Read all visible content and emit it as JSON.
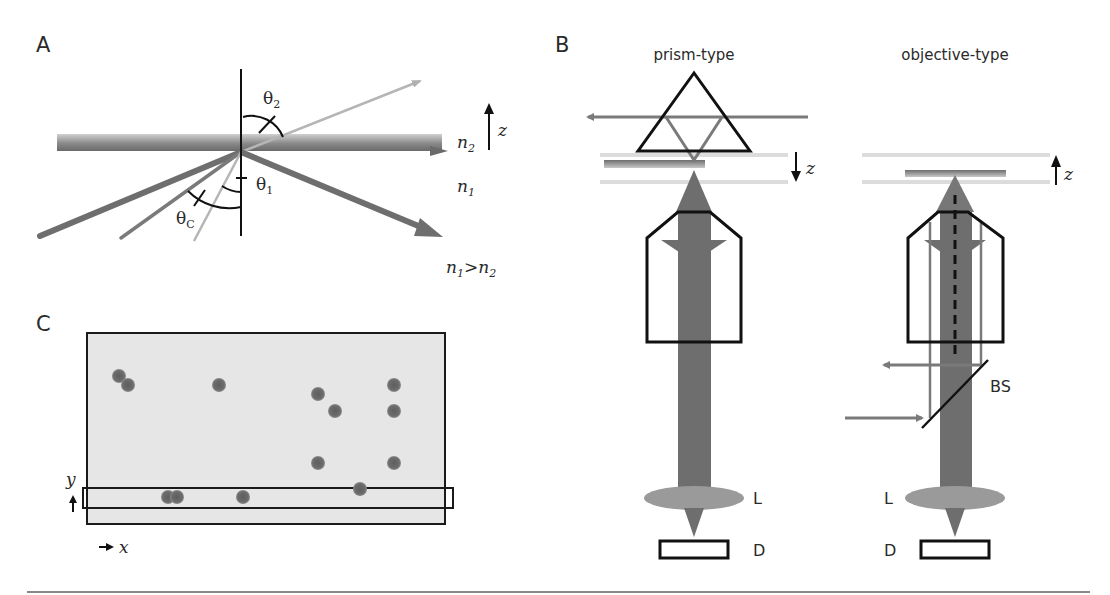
{
  "figure": {
    "panels": [
      {
        "id": "A",
        "label": "A",
        "description": "Total internal reflection at interface between media n1 and n2",
        "labels": {
          "theta2": "θ",
          "theta2_sub": "2",
          "theta1": "θ",
          "theta1_sub": "1",
          "thetaC": "θ",
          "thetaC_sub": "C",
          "n2": "n",
          "n2_sub": "2",
          "n1": "n",
          "n1_sub": "1",
          "condition_n1": "n",
          "condition_n1_sub": "1",
          "condition_gt": ">",
          "condition_n2": "n",
          "condition_n2_sub": "2",
          "z_axis": "z"
        }
      },
      {
        "id": "B",
        "label": "B",
        "subpanels": [
          {
            "title": "prism-type",
            "z_axis": "z",
            "z_direction": "down",
            "lens_label": "L",
            "detector_label": "D"
          },
          {
            "title": "objective-type",
            "z_axis": "z",
            "z_direction": "up",
            "beamsplitter_label": "BS",
            "lens_label": "L",
            "detector_label": "D"
          }
        ]
      },
      {
        "id": "C",
        "label": "C",
        "axis_x": "x",
        "axis_y": "y",
        "spots": [
          [
            119,
            376
          ],
          [
            128,
            385
          ],
          [
            219,
            385
          ],
          [
            318,
            394
          ],
          [
            335,
            411
          ],
          [
            394,
            385
          ],
          [
            394,
            411
          ],
          [
            318,
            463
          ],
          [
            394,
            463
          ],
          [
            360,
            489
          ],
          [
            168,
            497
          ],
          [
            177,
            497
          ],
          [
            243,
            497
          ]
        ]
      }
    ],
    "colors": {
      "ink": "#1a1a1a",
      "beam_dark": "#6e6e6e",
      "beam_mid": "#8a8a8a",
      "beam_light": "#b5b5b5",
      "interface": "#7a7a7a",
      "sample_field": "#e6e6e6",
      "spot": "#6a6a6a",
      "lens": "#9a9a9a",
      "sample_layer": "#d8d8d8"
    }
  }
}
